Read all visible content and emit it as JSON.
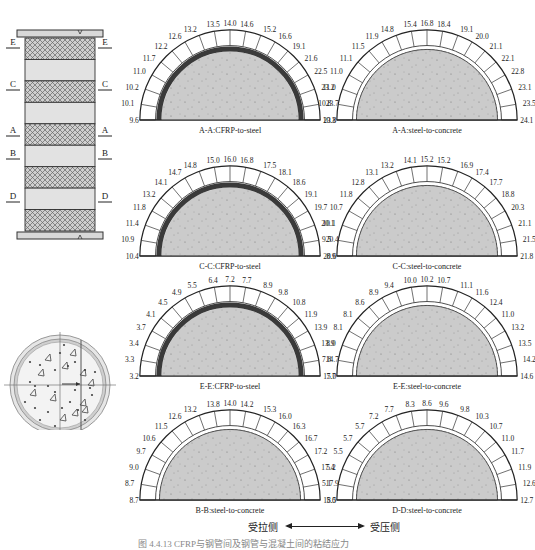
{
  "column_elevation": {
    "sections": [
      {
        "label": "E",
        "y": 46
      },
      {
        "label": "C",
        "y": 88
      },
      {
        "label": "A",
        "y": 134
      },
      {
        "label": "B",
        "y": 157
      },
      {
        "label": "D",
        "y": 200
      }
    ],
    "bands": [
      "cfrp",
      "plain",
      "cfrp",
      "plain",
      "cfrp",
      "plain",
      "cfrp",
      "plain",
      "cfrp"
    ]
  },
  "legend": {
    "tension_side": "受拉侧",
    "compression_side": "受压侧"
  },
  "caption": "图 4.4.13  CFRP与钢管间及钢管与混凝土间的粘结应力",
  "chart_data": [
    {
      "type": "semicircle-distribution",
      "id": "AA-cfrp",
      "title": "A-A:CFRP-to-steel",
      "cfrp": true,
      "values": [
        9.6,
        10.1,
        10.2,
        11.0,
        11.7,
        12.2,
        12.6,
        13.2,
        13.5,
        14.0,
        14.6,
        15.2,
        16.6,
        19.1,
        21.6,
        22.5,
        23.2,
        23.7,
        23.8
      ]
    },
    {
      "type": "semicircle-distribution",
      "id": "AA-steel",
      "title": "A-A:steel-to-concrete",
      "cfrp": false,
      "values": [
        10.3,
        10.8,
        11.0,
        11.0,
        11.1,
        11.5,
        11.9,
        14.8,
        15.4,
        16.8,
        18.4,
        19.1,
        20.0,
        21.1,
        22.1,
        22.8,
        23.1,
        23.5,
        24.1
      ]
    },
    {
      "type": "semicircle-distribution",
      "id": "CC-cfrp",
      "title": "C-C:CFRP-to-steel",
      "cfrp": true,
      "values": [
        10.4,
        10.9,
        11.4,
        11.8,
        13.2,
        14.1,
        14.7,
        14.8,
        15.0,
        16.0,
        16.8,
        17.5,
        18.1,
        18.6,
        19.1,
        19.7,
        20.1,
        20.4,
        20.6
      ]
    },
    {
      "type": "semicircle-distribution",
      "id": "CC-steel",
      "title": "C-C:steel-to-concrete",
      "cfrp": false,
      "values": [
        8.9,
        9.5,
        10.1,
        10.7,
        11.8,
        12.8,
        13.1,
        13.2,
        14.1,
        15.2,
        15.2,
        16.9,
        17.4,
        17.7,
        18.8,
        20.3,
        21.1,
        21.5,
        21.8
      ]
    },
    {
      "type": "semicircle-distribution",
      "id": "EE-cfrp",
      "title": "E-E:CFRP-to-steel",
      "cfrp": true,
      "values": [
        3.2,
        3.3,
        3.4,
        3.7,
        4.1,
        4.5,
        4.9,
        5.5,
        6.4,
        7.2,
        7.7,
        8.9,
        9.8,
        10.8,
        11.9,
        13.9,
        13.9,
        14.7,
        15.0
      ]
    },
    {
      "type": "semicircle-distribution",
      "id": "EE-steel",
      "title": "E-E:steel-to-concrete",
      "cfrp": false,
      "values": [
        7.7,
        7.8,
        8.0,
        8.1,
        8.1,
        8.6,
        8.9,
        9.4,
        10.0,
        10.2,
        10.7,
        11.1,
        11.6,
        12.4,
        11.0,
        13.2,
        13.5,
        14.2,
        14.6
      ]
    },
    {
      "type": "semicircle-distribution",
      "id": "BB-steel",
      "title": "B-B:steel-to-concrete",
      "cfrp": false,
      "values": [
        8.7,
        8.7,
        9.0,
        9.7,
        10.6,
        11.5,
        12.6,
        13.2,
        13.8,
        14.0,
        14.2,
        15.3,
        16.0,
        16.3,
        16.7,
        17.2,
        17.4,
        17.9,
        18.5
      ]
    },
    {
      "type": "semicircle-distribution",
      "id": "DD-steel",
      "title": "D-D:steel-to-concrete",
      "cfrp": false,
      "values": [
        5.0,
        5.1,
        5.2,
        5.5,
        5.7,
        5.7,
        7.2,
        7.7,
        8.3,
        8.6,
        9.6,
        9.8,
        10.3,
        10.7,
        11.0,
        11.7,
        11.9,
        12.6,
        12.7
      ]
    }
  ],
  "layout": {
    "panels": [
      {
        "cx": 230,
        "cy": 120
      },
      {
        "cx": 427,
        "cy": 120
      },
      {
        "cx": 230,
        "cy": 256
      },
      {
        "cx": 427,
        "cy": 256
      },
      {
        "cx": 230,
        "cy": 376
      },
      {
        "cx": 427,
        "cy": 376
      },
      {
        "cx": 230,
        "cy": 500
      },
      {
        "cx": 427,
        "cy": 500
      }
    ]
  }
}
